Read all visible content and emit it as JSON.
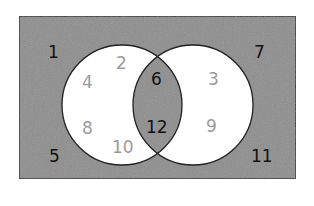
{
  "diagram": {
    "type": "venn",
    "colors": {
      "background": "#ffffff",
      "shaded": "#8e8e8e",
      "unshaded": "#ffffff",
      "stroke": "#222222",
      "text_dark": "#111111",
      "text_light": "#9a9a9a"
    },
    "universe": {
      "label": "universal set",
      "outside_values": [
        "1",
        "5",
        "7",
        "11"
      ]
    },
    "sets": [
      {
        "name": "left-circle",
        "only_values": [
          "2",
          "4",
          "8",
          "10"
        ]
      },
      {
        "name": "right-circle",
        "only_values": [
          "3",
          "9"
        ]
      }
    ],
    "intersection_values": [
      "6",
      "12"
    ],
    "labels": {
      "n1": "1",
      "n2": "2",
      "n3": "3",
      "n4": "4",
      "n5": "5",
      "n6": "6",
      "n7": "7",
      "n8": "8",
      "n9": "9",
      "n10": "10",
      "n11": "11",
      "n12": "12"
    },
    "shading_note": "Outside region and intersection shaded; left-only and right-only regions white"
  }
}
